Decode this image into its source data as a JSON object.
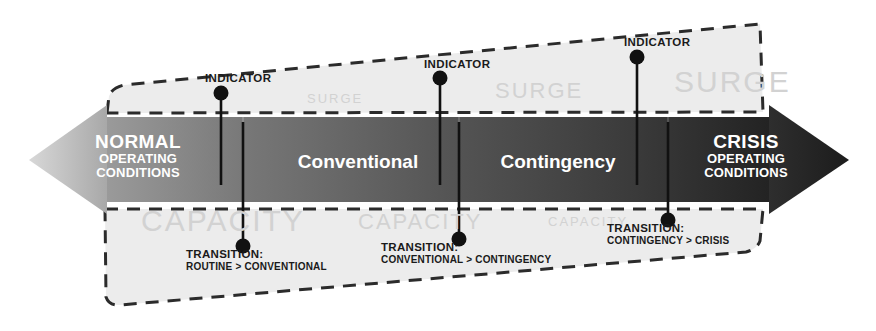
{
  "diagram": {
    "colors": {
      "arrow_left_tip": "#c9c9c9",
      "arrow_right_tip": "#2b2b2b",
      "band_start": "#8c8c8c",
      "band_end": "#2e2e2e",
      "wedge_fill": "#ececec",
      "ghost_text": "#d2d2d2",
      "callout_text": "#1a1a1a",
      "band_text": "#ffffff"
    },
    "left_end": {
      "title": "NORMAL",
      "line2": "OPERATING",
      "line3": "CONDITIONS"
    },
    "right_end": {
      "title": "CRISIS",
      "line2": "OPERATING",
      "line3": "CONDITIONS"
    },
    "band_segments": [
      {
        "label": "Conventional"
      },
      {
        "label": "Contingency"
      }
    ],
    "surge_labels": [
      {
        "text": "SURGE"
      },
      {
        "text": "SURGE"
      },
      {
        "text": "SURGE"
      }
    ],
    "capacity_labels": [
      {
        "text": "CAPACITY"
      },
      {
        "text": "CAPACITY"
      },
      {
        "text": "CAPACITY"
      }
    ],
    "indicators": [
      {
        "label": "INDICATOR"
      },
      {
        "label": "INDICATOR"
      },
      {
        "label": "INDICATOR"
      }
    ],
    "transitions": [
      {
        "title": "TRANSITION:",
        "detail": "ROUTINE > CONVENTIONAL"
      },
      {
        "title": "TRANSITION:",
        "detail": "CONVENTIONAL > CONTINGENCY"
      },
      {
        "title": "TRANSITION:",
        "detail": "CONTINGENCY > CRISIS"
      }
    ]
  }
}
